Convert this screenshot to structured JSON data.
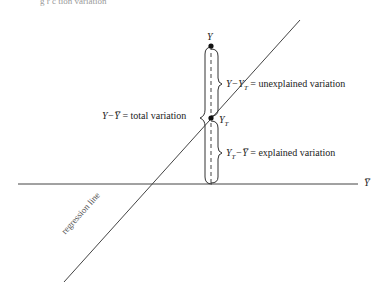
{
  "figure": {
    "top_caption_fragment": "g r  c    tion   variation",
    "points": {
      "observed": {
        "label": "Y",
        "x": 211,
        "y": 46
      },
      "predicted": {
        "label": "Y",
        "subscript": "T",
        "x": 211,
        "y": 118
      }
    },
    "annotations": {
      "unexplained": {
        "lhs": "Y−Y",
        "lhs_sub": "T",
        "eq": " = ",
        "text": "unexplained variation"
      },
      "total": {
        "lhs": "Y−Y̅",
        "eq": " = ",
        "text": "total variation"
      },
      "explained": {
        "lhs": "Y",
        "lhs_sub": "T",
        "lhs_rest": "−Y̅",
        "eq": " = ",
        "text": "explained variation"
      }
    },
    "mean_line_label": "Y̅",
    "regression_line_label": "regression line",
    "colors": {
      "ink": "#222222",
      "line": "#444444"
    }
  }
}
